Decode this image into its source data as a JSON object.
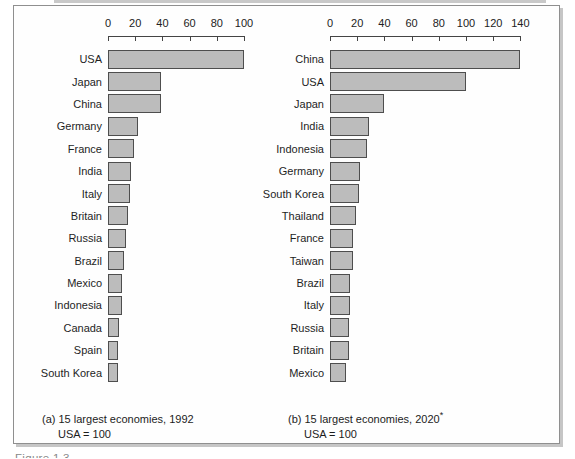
{
  "figure": {
    "partial_text_bottom": "Figure 1.3",
    "colors": {
      "bar_fill": "#bcbcbc",
      "bar_border": "#4e4e4e",
      "axis": "#444444",
      "frame_border": "#8f8f8f",
      "frame_shadow": "#c6c6c6",
      "text": "#1c1c1c"
    }
  },
  "chart_data": [
    {
      "type": "bar",
      "orientation": "horizontal",
      "title": "(a) 15 largest economies, 1992",
      "title_superscript": "",
      "subtitle": "USA = 100",
      "categories": [
        "USA",
        "Japan",
        "China",
        "Germany",
        "France",
        "India",
        "Italy",
        "Britain",
        "Russia",
        "Brazil",
        "Mexico",
        "Indonesia",
        "Canada",
        "Spain",
        "South Korea"
      ],
      "values": [
        100,
        39,
        39,
        22,
        19,
        17,
        16,
        15,
        13,
        12,
        10,
        10,
        8,
        7,
        7
      ],
      "xlim": [
        0,
        100
      ],
      "xticks": [
        0,
        20,
        40,
        60,
        80,
        100
      ],
      "axis_position": "top",
      "grid": false,
      "legend": false
    },
    {
      "type": "bar",
      "orientation": "horizontal",
      "title": "(b) 15 largest economies, 2020",
      "title_superscript": "*",
      "subtitle": "USA = 100",
      "categories": [
        "China",
        "USA",
        "Japan",
        "India",
        "Indonesia",
        "Germany",
        "South Korea",
        "Thailand",
        "France",
        "Taiwan",
        "Brazil",
        "Italy",
        "Russia",
        "Britain",
        "Mexico"
      ],
      "values": [
        140,
        100,
        40,
        29,
        27,
        22,
        21,
        19,
        17,
        17,
        15,
        15,
        14,
        14,
        12
      ],
      "xlim": [
        0,
        140
      ],
      "xticks": [
        0,
        20,
        40,
        60,
        80,
        100,
        120,
        140
      ],
      "axis_position": "top",
      "grid": false,
      "legend": false
    }
  ]
}
